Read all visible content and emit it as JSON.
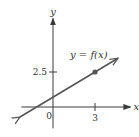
{
  "chart_data": {
    "type": "line",
    "title": "",
    "xlabel": "x",
    "ylabel": "y",
    "origin_label": "0",
    "x_ticks": [
      {
        "value": 3,
        "label": "3"
      }
    ],
    "y_ticks": [
      {
        "value": 2.5,
        "label": "2.5"
      }
    ],
    "xlim": [
      -2.4,
      5.6
    ],
    "ylim": [
      -1.6,
      6.4
    ],
    "series": [
      {
        "name": "y = f(x)",
        "kind": "line-with-arrows",
        "slope": 0.6,
        "intercept": 0.7,
        "x_range": [
          -2.36,
          4.64
        ],
        "color": "#555555"
      }
    ],
    "marked_points": [
      {
        "x": 3,
        "y": 2.5,
        "color": "#555555"
      }
    ],
    "annotations": [
      {
        "text": "y = f(x)",
        "anchor": "above line, upper right"
      }
    ],
    "grid": false,
    "legend": "none"
  }
}
